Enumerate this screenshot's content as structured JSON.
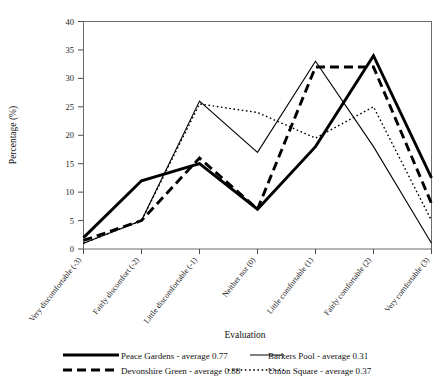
{
  "chart_data": {
    "type": "line",
    "title": "",
    "xlabel": "Evaluation",
    "ylabel": "Percentage (%)",
    "ylim": [
      0,
      40
    ],
    "ytick_values": [
      0,
      5,
      10,
      15,
      20,
      25,
      30,
      35,
      40
    ],
    "ytick_labels": [
      "0",
      "5",
      "10",
      "15",
      "20",
      "25",
      "30",
      "35",
      "40"
    ],
    "grid": false,
    "legend_position": "below-axis",
    "categories": [
      "Very discomfortable (-3)",
      "Fairly discomfort (-2)",
      "Little discomfortable (-1)",
      "Neither nor (0)",
      "Little comfortable (1)",
      "Fairly comfortable (2)",
      "Very comfortable (3)"
    ],
    "series": [
      {
        "name": "Peace Gardens",
        "legend_label": "Peace Gardens - average 0.77",
        "average": 0.77,
        "style": "thick-solid",
        "color": "#000000",
        "values": [
          2,
          12,
          15,
          7,
          18,
          34,
          12.5
        ]
      },
      {
        "name": "Barkers Pool",
        "legend_label": "Barkers Pool - average 0.31",
        "average": 0.31,
        "style": "thin-solid",
        "color": "#000000",
        "values": [
          1,
          5,
          26,
          17,
          33,
          18,
          1
        ]
      },
      {
        "name": "Devonshire Green",
        "legend_label": "Devonshire Green - average 0.88",
        "average": 0.88,
        "style": "thick-dashed",
        "color": "#000000",
        "values": [
          1.5,
          5,
          16,
          7,
          32,
          32,
          8
        ]
      },
      {
        "name": "Union Square",
        "legend_label": "Union  Square - average 0.37",
        "average": 0.37,
        "style": "dotted",
        "color": "#000000",
        "values": [
          1,
          5,
          25.5,
          24,
          19.5,
          25,
          5
        ]
      }
    ]
  },
  "legend": {
    "entries": [
      {
        "label": "Peace Gardens - average 0.77"
      },
      {
        "label": "Barkers Pool - average 0.31"
      },
      {
        "label": "Devonshire Green - average 0.88"
      },
      {
        "label": "Union  Square - average 0.37"
      }
    ]
  }
}
